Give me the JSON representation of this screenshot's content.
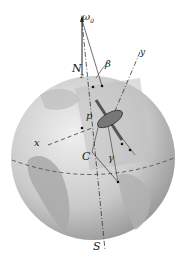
{
  "diagram": {
    "labels": {
      "omega": "ω",
      "omega_sub": "0",
      "north": "N",
      "beta": "β",
      "z": "z",
      "y": "y",
      "x": "x",
      "p": "p",
      "center": "C",
      "gamma": "γ",
      "south": "S"
    },
    "colors": {
      "globe_light": "#d8d8d8",
      "globe_dark": "#9a9a9a",
      "land": "#b4b4b4",
      "plane": "#c8c8c8",
      "lines": "#333333"
    }
  }
}
